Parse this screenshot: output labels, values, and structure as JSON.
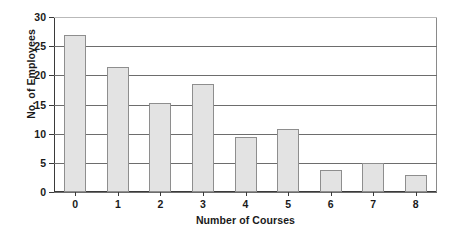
{
  "chart_data": {
    "type": "bar",
    "title": "",
    "xlabel": "Number of Courses",
    "ylabel": "No. of Employees",
    "categories": [
      "0",
      "1",
      "2",
      "3",
      "4",
      "5",
      "6",
      "7",
      "8"
    ],
    "values": [
      27,
      21.5,
      15.3,
      18.5,
      9.5,
      10.8,
      3.7,
      5,
      3
    ],
    "ylim": [
      0,
      30
    ],
    "yticks": [
      "0",
      "5",
      "10",
      "15",
      "20",
      "25",
      "30"
    ],
    "ytick_values": [
      0,
      5,
      10,
      15,
      20,
      25,
      30
    ],
    "grid": "horizontal",
    "legend": "none",
    "bar_fill_color": "#e3e3e3",
    "bar_border_color": "#8e8e8e",
    "axis_color": "#3a3a3a",
    "gridline_color": "#6d6d6d",
    "background_color": "#ffffff"
  }
}
